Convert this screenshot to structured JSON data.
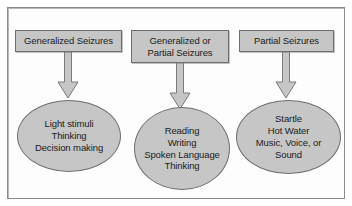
{
  "diagram": {
    "colors": {
      "node_fill": "#c6c6c6",
      "node_border": "#6e6e6e",
      "arrow_fill": "#c6c6c6",
      "arrow_border": "#7a7a7a",
      "frame_border": "#8a8a8a",
      "background": "#ffffff",
      "text": "#1a1a1a"
    },
    "columns": [
      {
        "id": "generalized",
        "box": {
          "label": "Generalized Seizures",
          "lines": [
            "Generalized Seizures"
          ]
        },
        "arrow": {
          "name": "down-arrow"
        },
        "ellipse": {
          "label": "Light stimuli Thinking Decision making",
          "lines": [
            "Light stimuli",
            "Thinking",
            "Decision making"
          ]
        }
      },
      {
        "id": "generalized-or-partial",
        "box": {
          "label": "Generalized or Partial Seizures",
          "lines": [
            "Generalized or",
            "Partial Seizures"
          ]
        },
        "arrow": {
          "name": "down-arrow"
        },
        "ellipse": {
          "label": "Reading Writing Spoken Language Thinking",
          "lines": [
            "Reading",
            "Writing",
            "Spoken Language",
            "Thinking"
          ]
        }
      },
      {
        "id": "partial",
        "box": {
          "label": "Partial Seizures",
          "lines": [
            "Partial Seizures"
          ]
        },
        "arrow": {
          "name": "down-arrow"
        },
        "ellipse": {
          "label": "Startle Hot Water Music, Voice, or Sound",
          "lines": [
            "Startle",
            "Hot Water",
            "Music, Voice, or",
            "Sound"
          ]
        }
      }
    ]
  }
}
